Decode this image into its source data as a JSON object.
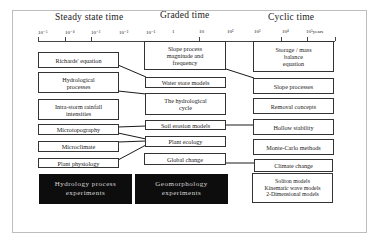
{
  "headers": {
    "steady": "Steady state time",
    "graded": "Graded time",
    "cyclic": "Cyclic time"
  },
  "axis": {
    "ticks": [
      "10⁻⁵",
      "10⁻⁴",
      "10⁻³",
      "10⁻²",
      "10⁻¹",
      "1",
      "10",
      "10²",
      "10³",
      "10⁴",
      "10⁵years"
    ]
  },
  "left_column": [
    "Richards' equation",
    "Hydrological\nprocesses",
    "Intra-storm rainfall\nintensities",
    "Microtopography",
    "Microclimate",
    "Plant physiology"
  ],
  "middle_column": [
    "Slope process\nmagnitude and\nfrequency",
    "Water store models",
    "The hydrological\ncycle",
    "Soil erosion models",
    "Plant ecology",
    "Global change"
  ],
  "right_column": [
    "Storage / mass\nbalance\nequation",
    "Slope processes",
    "Removal concepts",
    "Hollow stability",
    "Monte-Carlo methods",
    "Climate change",
    "Soliton models\nKinematic wave models\n2-Dimensional models"
  ],
  "experiments": {
    "hydrology": "Hydrology process\nexperiments",
    "geomorphology": "Geomorphology\nexperiments"
  },
  "colors": {
    "box_border": "#333333",
    "dark_box": "#0d0d0d",
    "dark_text": "#d8d8d8",
    "frame": "#bdbdbd"
  }
}
